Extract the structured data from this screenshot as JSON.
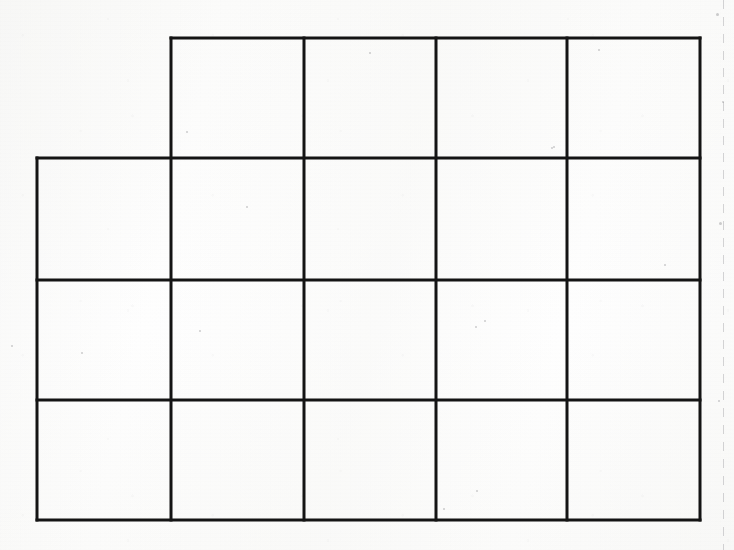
{
  "page": {
    "width": 734,
    "height": 550,
    "background_color": "#fbfbfa"
  },
  "grid": {
    "description": "Hand-ruled blank rectangular grid on scanned white paper",
    "line_color": "#141414",
    "line_width": 3,
    "cell_fill": "none",
    "x_lines": [
      37,
      171,
      304,
      436,
      567,
      700
    ],
    "y_lines": [
      38,
      158,
      280,
      400,
      520
    ],
    "rows": [
      {
        "index": 0,
        "y_top": 38,
        "y_bottom": 158,
        "x_start": 171,
        "x_end": 700,
        "cell_count": 4,
        "cells": [
          {
            "x": 171,
            "y": 38,
            "w": 133,
            "h": 120,
            "label": ""
          },
          {
            "x": 304,
            "y": 38,
            "w": 132,
            "h": 120,
            "label": ""
          },
          {
            "x": 436,
            "y": 38,
            "w": 131,
            "h": 120,
            "label": ""
          },
          {
            "x": 567,
            "y": 38,
            "w": 133,
            "h": 120,
            "label": ""
          }
        ]
      },
      {
        "index": 1,
        "y_top": 158,
        "y_bottom": 280,
        "x_start": 37,
        "x_end": 700,
        "cell_count": 5,
        "cells": [
          {
            "x": 37,
            "y": 158,
            "w": 134,
            "h": 122,
            "label": ""
          },
          {
            "x": 171,
            "y": 158,
            "w": 133,
            "h": 122,
            "label": ""
          },
          {
            "x": 304,
            "y": 158,
            "w": 132,
            "h": 122,
            "label": ""
          },
          {
            "x": 436,
            "y": 158,
            "w": 131,
            "h": 122,
            "label": ""
          },
          {
            "x": 567,
            "y": 158,
            "w": 133,
            "h": 122,
            "label": ""
          }
        ]
      },
      {
        "index": 2,
        "y_top": 280,
        "y_bottom": 400,
        "x_start": 37,
        "x_end": 700,
        "cell_count": 5,
        "cells": [
          {
            "x": 37,
            "y": 280,
            "w": 134,
            "h": 120,
            "label": ""
          },
          {
            "x": 171,
            "y": 280,
            "w": 133,
            "h": 120,
            "label": ""
          },
          {
            "x": 304,
            "y": 280,
            "w": 132,
            "h": 120,
            "label": ""
          },
          {
            "x": 436,
            "y": 280,
            "w": 131,
            "h": 120,
            "label": ""
          },
          {
            "x": 567,
            "y": 280,
            "w": 133,
            "h": 120,
            "label": ""
          }
        ]
      },
      {
        "index": 3,
        "y_top": 400,
        "y_bottom": 520,
        "x_start": 37,
        "x_end": 700,
        "cell_count": 5,
        "cells": [
          {
            "x": 37,
            "y": 400,
            "w": 134,
            "h": 120,
            "label": ""
          },
          {
            "x": 171,
            "y": 400,
            "w": 133,
            "h": 120,
            "label": ""
          },
          {
            "x": 304,
            "y": 400,
            "w": 132,
            "h": 120,
            "label": ""
          },
          {
            "x": 436,
            "y": 400,
            "w": 131,
            "h": 120,
            "label": ""
          },
          {
            "x": 567,
            "y": 400,
            "w": 133,
            "h": 120,
            "label": ""
          }
        ]
      }
    ],
    "total_cells": 19,
    "segments": {
      "horizontal": [
        {
          "x1": 171,
          "x2": 700,
          "y": 38
        },
        {
          "x1": 37,
          "x2": 700,
          "y": 158
        },
        {
          "x1": 37,
          "x2": 700,
          "y": 280
        },
        {
          "x1": 37,
          "x2": 700,
          "y": 400
        },
        {
          "x1": 37,
          "x2": 700,
          "y": 520
        }
      ],
      "vertical": [
        {
          "y1": 158,
          "y2": 520,
          "x": 37
        },
        {
          "y1": 38,
          "y2": 520,
          "x": 171
        },
        {
          "y1": 38,
          "y2": 520,
          "x": 304
        },
        {
          "y1": 38,
          "y2": 520,
          "x": 436
        },
        {
          "y1": 38,
          "y2": 520,
          "x": 567
        },
        {
          "y1": 38,
          "y2": 520,
          "x": 700
        }
      ]
    }
  },
  "margin_rule": {
    "name": "dashed-right-margin",
    "x": 723,
    "color": "#969699",
    "style": "dashed"
  },
  "specks": [
    {
      "x": 716,
      "y": 13,
      "d": 3
    },
    {
      "x": 598,
      "y": 49,
      "d": 2
    },
    {
      "x": 722,
      "y": 101,
      "d": 2
    },
    {
      "x": 186,
      "y": 131,
      "d": 2
    },
    {
      "x": 553,
      "y": 146,
      "d": 2
    },
    {
      "x": 551,
      "y": 147,
      "d": 2
    },
    {
      "x": 11,
      "y": 345,
      "d": 2
    },
    {
      "x": 719,
      "y": 222,
      "d": 3
    },
    {
      "x": 484,
      "y": 320,
      "d": 2
    },
    {
      "x": 476,
      "y": 490,
      "d": 2
    },
    {
      "x": 443,
      "y": 508,
      "d": 2
    },
    {
      "x": 81,
      "y": 352,
      "d": 2
    },
    {
      "x": 475,
      "y": 326,
      "d": 2
    },
    {
      "x": 664,
      "y": 264,
      "d": 2
    },
    {
      "x": 199,
      "y": 330,
      "d": 2
    },
    {
      "x": 718,
      "y": 400,
      "d": 2
    },
    {
      "x": 369,
      "y": 52,
      "d": 2
    },
    {
      "x": 246,
      "y": 206,
      "d": 2
    }
  ]
}
